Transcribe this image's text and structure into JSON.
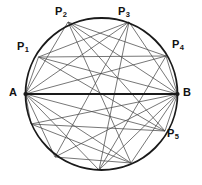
{
  "figure": {
    "background_color": "#ffffff",
    "stroke_color": "#1a1a1a",
    "chord_color": "#4a4a4a",
    "circle": {
      "center_x": 101.5,
      "center_y": 94,
      "radius": 76,
      "stroke_width": 1.8
    },
    "points": {
      "A": {
        "x": 25.5,
        "y": 94,
        "label": "A",
        "sub": "",
        "label_x": 9,
        "label_y": 87
      },
      "B": {
        "x": 177.5,
        "y": 94,
        "label": "B",
        "sub": "",
        "label_x": 183,
        "label_y": 87
      },
      "P1": {
        "x": 38.5,
        "y": 57,
        "label": "P",
        "sub": "1",
        "label_x": 17,
        "label_y": 41
      },
      "P2": {
        "x": 68,
        "y": 22,
        "label": "P",
        "sub": "2",
        "label_x": 55,
        "label_y": 6
      },
      "P3": {
        "x": 129,
        "y": 22,
        "label": "P",
        "sub": "3",
        "label_x": 118,
        "label_y": 6
      },
      "P4": {
        "x": 166,
        "y": 56,
        "label": "P",
        "sub": "4",
        "label_x": 172,
        "label_y": 39
      },
      "P5": {
        "x": 165,
        "y": 131,
        "label": "P",
        "sub": "5",
        "label_x": 167,
        "label_y": 128
      },
      "Q1": {
        "x": 31,
        "y": 124,
        "label": "",
        "sub": "",
        "label_x": 0,
        "label_y": 0
      },
      "Q2": {
        "x": 55,
        "y": 157,
        "label": "",
        "sub": "",
        "label_x": 0,
        "label_y": 0
      },
      "Q3": {
        "x": 99,
        "y": 170,
        "label": "",
        "sub": "",
        "label_x": 0,
        "label_y": 0
      },
      "Q4": {
        "x": 131,
        "y": 163,
        "label": "",
        "sub": "",
        "label_x": 0,
        "label_y": 0
      }
    },
    "diameter": {
      "from": "A",
      "to": "B",
      "stroke_width": 2.2
    },
    "spokes_from_A": [
      "P1",
      "P2",
      "P3",
      "P4",
      "P5",
      "Q1",
      "Q2",
      "Q3",
      "Q4"
    ],
    "spokes_from_B": [
      "P1",
      "P2",
      "P3",
      "P4",
      "P5",
      "Q1",
      "Q2",
      "Q3",
      "Q4"
    ],
    "cross_chords": [
      [
        "P1",
        "P3"
      ],
      [
        "P1",
        "P4"
      ],
      [
        "P2",
        "P4"
      ],
      [
        "P2",
        "P5"
      ],
      [
        "P1",
        "P5"
      ],
      [
        "P2",
        "Q4"
      ],
      [
        "P3",
        "Q2"
      ],
      [
        "P3",
        "Q3"
      ],
      [
        "Q1",
        "P5"
      ],
      [
        "Q1",
        "Q4"
      ],
      [
        "Q2",
        "Q4"
      ],
      [
        "Q3",
        "P4"
      ]
    ],
    "labels_order": [
      "P1",
      "P2",
      "P3",
      "P4",
      "P5",
      "A",
      "B"
    ]
  }
}
